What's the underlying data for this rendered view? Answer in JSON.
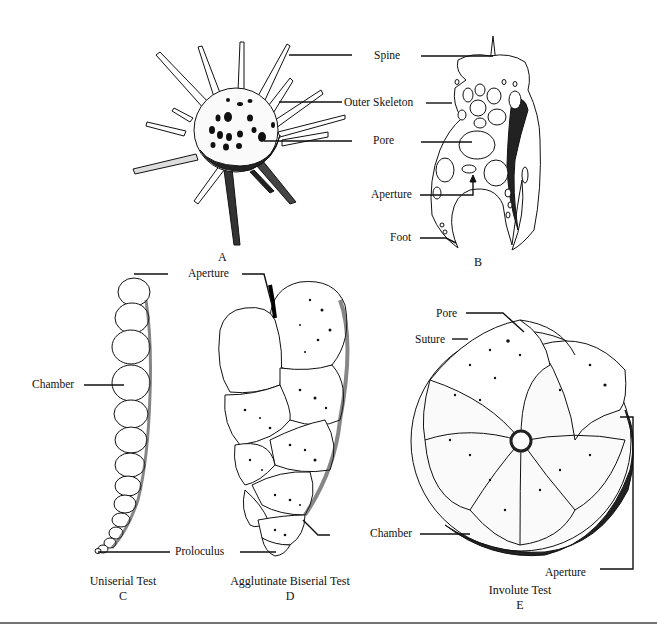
{
  "figure": {
    "panels": [
      {
        "id": "A",
        "caption": "",
        "letter": "A"
      },
      {
        "id": "B",
        "caption": "",
        "letter": "B",
        "labels": [
          "Spine",
          "Outer Skeleton",
          "Pore",
          "Aperture",
          "Foot"
        ]
      },
      {
        "id": "C",
        "caption": "Uniserial Test",
        "letter": "C",
        "labels": [
          "Chamber"
        ]
      },
      {
        "id": "D",
        "caption": "Agglutinate Biserial Test",
        "letter": "D",
        "labels": [
          "Aperture",
          "Proloculus"
        ]
      },
      {
        "id": "E",
        "caption": "Involute Test",
        "letter": "E",
        "labels": [
          "Pore",
          "Suture",
          "Chamber",
          "Aperture"
        ]
      }
    ]
  },
  "labels": {
    "spine": "Spine",
    "outer_skeleton": "Outer Skeleton",
    "pore_b": "Pore",
    "aperture_b": "Aperture",
    "foot": "Foot",
    "chamber_c": "Chamber",
    "aperture_d": "Aperture",
    "proloculus": "Proloculus",
    "pore_e": "Pore",
    "suture": "Suture",
    "chamber_e": "Chamber",
    "aperture_e": "Aperture"
  },
  "captions": {
    "a_letter": "A",
    "b_letter": "B",
    "c_title": "Uniserial Test",
    "c_letter": "C",
    "d_title": "Agglutinate Biserial Test",
    "d_letter": "D",
    "e_title": "Involute Test",
    "e_letter": "E"
  }
}
